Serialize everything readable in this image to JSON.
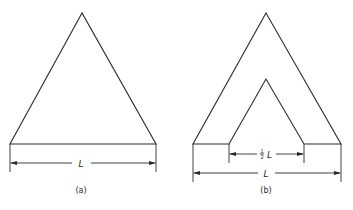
{
  "figure_a": {
    "caption": "(a)",
    "dimension_label": "L",
    "shape": "solid triangle"
  },
  "figure_b": {
    "caption": "(b)",
    "outer_dimension_label": "L",
    "inner_dimension_fraction_num": "1",
    "inner_dimension_fraction_den": "2",
    "inner_dimension_symbol": "L",
    "shape": "triangle with triangular notch"
  },
  "colors": {
    "line": "#2a2a2a",
    "background": "#ffffff"
  }
}
